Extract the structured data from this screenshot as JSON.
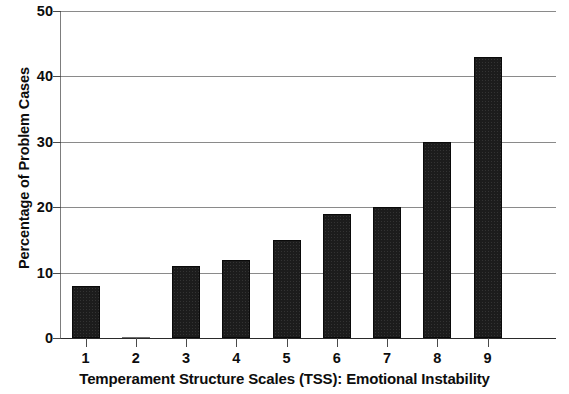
{
  "chart_data": {
    "type": "bar",
    "title": "",
    "subtitle": "",
    "xlabel": "Temperament Structure Scales (TSS): Emotional Instability",
    "ylabel": "Percentage of Problem Cases",
    "categories": [
      "1",
      "2",
      "3",
      "4",
      "5",
      "6",
      "7",
      "8",
      "9"
    ],
    "values": [
      8,
      0,
      11,
      12,
      15,
      19,
      20,
      30,
      43
    ],
    "series": [
      {
        "name": "Percentage of Problem Cases",
        "values": [
          8,
          0,
          11,
          12,
          15,
          19,
          20,
          30,
          43
        ]
      }
    ],
    "ylim": [
      0,
      50
    ],
    "xlim": [
      0.4,
      9.6
    ],
    "ytick_labels": [
      "0",
      "10",
      "20",
      "30",
      "40",
      "50"
    ],
    "ytick_values": [
      0,
      10,
      20,
      30,
      40,
      50
    ],
    "ytick_interval": 10,
    "xtick_labels": [
      "1",
      "2",
      "3",
      "4",
      "5",
      "6",
      "7",
      "8",
      "9"
    ],
    "grid": true,
    "grid_axis": "y",
    "legend": false,
    "legend_position": "none",
    "annotations": [],
    "colors": {
      "bar_fill": "#1c1c1c",
      "bar_edge": "#0a0a0a",
      "gridline": "#8a8a8a",
      "axis_line": "#7d7d7d",
      "text": "#0d0d0d",
      "background": "#ffffff"
    }
  }
}
